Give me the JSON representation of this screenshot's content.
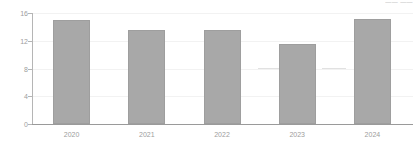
{
  "corner_note": "—— ——",
  "chart_data": {
    "type": "bar",
    "title": "",
    "subtitle": "",
    "xlabel": "",
    "ylabel": "",
    "categories": [
      "2020",
      "2021",
      "2022",
      "2023",
      "2024"
    ],
    "values": [
      15.0,
      13.5,
      13.5,
      11.5,
      15.2
    ],
    "series": [
      {
        "name": "",
        "values": [
          15.0,
          13.5,
          13.5,
          11.5,
          15.2
        ]
      }
    ],
    "ylim": [
      0,
      16
    ],
    "xlim": [
      0,
      5
    ],
    "ytick_labels": [
      "0",
      "4",
      "8",
      "12",
      "16"
    ],
    "ytick_values": [
      0,
      4,
      8,
      12,
      16
    ],
    "xtick_labels": [
      "2020",
      "2021",
      "2022",
      "2023",
      "2024"
    ],
    "grid": true,
    "grid_axis": "y",
    "legend": false,
    "legend_position": "none",
    "bar_color": "#a8a8a8",
    "bar_edge_color": "#9e9e9e",
    "gridline_color": "#f2f2f2",
    "axis_color": "#b5b5b5",
    "baseline_color": "#9a9a9a",
    "tick_label_color": "#9d9d9d",
    "background_color": "#ffffff",
    "annotations": []
  }
}
